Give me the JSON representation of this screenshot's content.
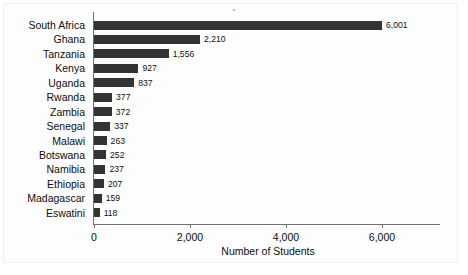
{
  "chart_data": {
    "type": "bar",
    "orientation": "horizontal",
    "title": "",
    "xlabel": "Number of Students",
    "ylabel": "",
    "categories": [
      "South Africa",
      "Ghana",
      "Tanzania",
      "Kenya",
      "Uganda",
      "Rwanda",
      "Zambia",
      "Senegal",
      "Malawi",
      "Botswana",
      "Namibia",
      "Ethiopia",
      "Madagascar",
      "Eswatini"
    ],
    "values": [
      6001,
      2210,
      1556,
      927,
      837,
      377,
      372,
      337,
      263,
      252,
      237,
      207,
      159,
      118
    ],
    "value_labels": [
      "6,001",
      "2,210",
      "1,556",
      "927",
      "837",
      "377",
      "372",
      "337",
      "263",
      "252",
      "237",
      "207",
      "159",
      "118"
    ],
    "xlim": [
      0,
      6400
    ],
    "xticks": [
      0,
      2000,
      4000,
      6000
    ],
    "xtick_labels": [
      "0",
      "2,000",
      "4,000",
      "6,000"
    ],
    "grid": false,
    "legend": false,
    "bar_color": "#333333",
    "axis_color": "#6f6f6f",
    "text_color": "#0d0d0d",
    "background_color": "#ffffff"
  }
}
